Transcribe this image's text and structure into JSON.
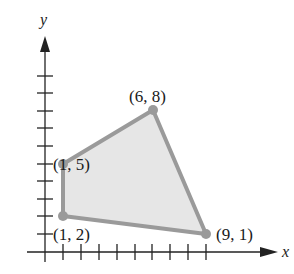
{
  "figure": {
    "axes": {
      "x_label": "x",
      "y_label": "y",
      "origin_px": [
        45,
        252
      ],
      "unit_px": [
        17.9,
        17.6
      ],
      "x_ticks": [
        1,
        2,
        3,
        4,
        5,
        6,
        7,
        8,
        9
      ],
      "y_ticks": [
        1,
        2,
        3,
        4,
        5,
        6,
        7,
        8,
        9,
        10
      ]
    },
    "region": {
      "fill_color": "#e6e6e6",
      "edge_color": "#9a9a9a",
      "vertex_color": "#9a9a9a"
    },
    "vertices": [
      {
        "label": "(1, 5)",
        "x": 1,
        "y": 5
      },
      {
        "label": "(6, 8)",
        "x": 6,
        "y": 8
      },
      {
        "label": "(9, 1)",
        "x": 9,
        "y": 1
      },
      {
        "label": "(1, 2)",
        "x": 1,
        "y": 2
      }
    ]
  }
}
